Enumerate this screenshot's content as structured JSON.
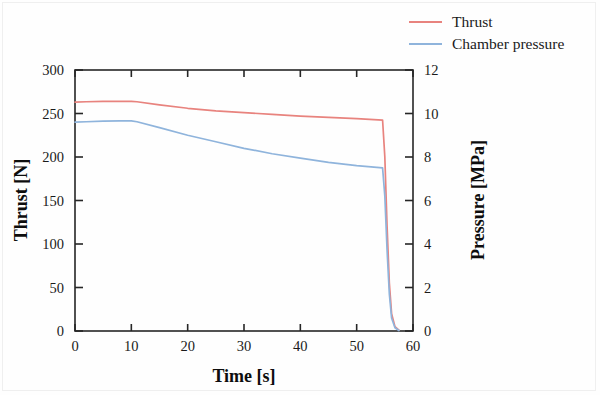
{
  "chart_data": {
    "type": "line",
    "title": "",
    "xlabel": "Time [s]",
    "ylabel": "Thrust [N]",
    "y2label": "Pressure [MPa]",
    "xlim": [
      0,
      60
    ],
    "ylim": [
      0,
      300
    ],
    "y2lim": [
      0,
      12
    ],
    "xticks": [
      0,
      10,
      20,
      30,
      40,
      50,
      60
    ],
    "yticks": [
      0,
      50,
      100,
      150,
      200,
      250,
      300
    ],
    "y2ticks": [
      0,
      2,
      4,
      6,
      8,
      10,
      12
    ],
    "grid": false,
    "legend_position": "top-right",
    "series": [
      {
        "name": "Thrust",
        "axis": "left",
        "unit": "N",
        "color": "#e8837e",
        "x": [
          0,
          2,
          5,
          8,
          10,
          11,
          15,
          20,
          25,
          30,
          35,
          40,
          45,
          50,
          54.6,
          55.0,
          55.4,
          55.8,
          56.2,
          56.8,
          57.5
        ],
        "y": [
          263,
          263.5,
          264,
          264,
          264,
          263.5,
          260,
          256,
          253,
          251,
          249,
          247,
          245.5,
          244,
          242.5,
          200,
          120,
          55,
          20,
          5,
          1
        ]
      },
      {
        "name": "Chamber pressure",
        "axis": "right",
        "unit": "MPa",
        "color": "#8fb4dc",
        "x": [
          0,
          2,
          5,
          8,
          10,
          11,
          15,
          20,
          25,
          30,
          35,
          40,
          45,
          50,
          54.6,
          55.0,
          55.4,
          55.8,
          56.2,
          56.8,
          57.5
        ],
        "y": [
          9.6,
          9.62,
          9.65,
          9.66,
          9.66,
          9.62,
          9.35,
          9.0,
          8.7,
          8.4,
          8.15,
          7.95,
          7.75,
          7.6,
          7.5,
          6.2,
          3.7,
          1.7,
          0.6,
          0.15,
          0.02
        ]
      }
    ]
  },
  "legend": {
    "items": [
      {
        "label": "Thrust",
        "color": "#e8837e"
      },
      {
        "label": "Chamber pressure",
        "color": "#8fb4dc"
      }
    ]
  },
  "axes": {
    "x_title": "Time [s]",
    "y_left_title": "Thrust [N]",
    "y_right_title": "Pressure [MPa]",
    "x_tick_labels": [
      "0",
      "10",
      "20",
      "30",
      "40",
      "50",
      "60"
    ],
    "y_left_tick_labels": [
      "0",
      "50",
      "100",
      "150",
      "200",
      "250",
      "300"
    ],
    "y_right_tick_labels": [
      "0",
      "2",
      "4",
      "6",
      "8",
      "10",
      "12"
    ]
  },
  "colors": {
    "thrust": "#e8837e",
    "pressure": "#8fb4dc",
    "axis": "#262626",
    "background": "#fefefe"
  }
}
